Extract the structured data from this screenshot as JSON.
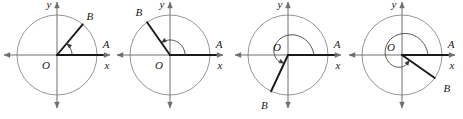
{
  "figure_set": {
    "description": "Four unit-circle diagrams showing angles in standard position with initial side OA on the positive x-axis and terminal side OB",
    "count": 4,
    "colors": {
      "axis": "#6e6e6e",
      "circle": "#8a8a8a",
      "ray": "#1a1a1a",
      "arc": "#3a3a3a",
      "label": "#1a1a1a",
      "background": "#ffffff"
    },
    "labels": {
      "origin": "O",
      "x_axis": "x",
      "y_axis": "y",
      "point_a": "A",
      "point_b": "B"
    }
  },
  "chart_data": {
    "type": "scatter",
    "title": "",
    "xlabel": "x",
    "ylabel": "y",
    "grid": false,
    "legend": null,
    "figures": [
      {
        "index": 1,
        "origin_label": "O",
        "origin_label_position": "below-left",
        "x_axis_label": "x",
        "y_axis_label": "y",
        "point_a_label": "A",
        "point_a_angle_deg": 0,
        "point_b_label": "B",
        "point_b_angle_deg": 50,
        "point_b_label_position": "upper-right-outside",
        "terminal_side_angle_deg": 50,
        "arc_start_deg": 0,
        "arc_end_deg": 50,
        "arc_turns": 0,
        "arc_direction": "counterclockwise",
        "quadrant": "I"
      },
      {
        "index": 2,
        "origin_label": "O",
        "origin_label_position": "below-left",
        "x_axis_label": "x",
        "y_axis_label": "y",
        "point_a_label": "A",
        "point_a_angle_deg": 0,
        "point_b_label": "B",
        "point_b_angle_deg": 125,
        "point_b_label_position": "upper-left-outside",
        "terminal_side_angle_deg": 125,
        "arc_start_deg": 0,
        "arc_end_deg": 125,
        "arc_turns": 0,
        "arc_direction": "counterclockwise",
        "quadrant": "II"
      },
      {
        "index": 3,
        "origin_label": "O",
        "origin_label_position": "above-left",
        "x_axis_label": "x",
        "y_axis_label": "y",
        "point_a_label": "A",
        "point_a_angle_deg": 0,
        "point_b_label": "B",
        "point_b_angle_deg": 245,
        "point_b_label_position": "lower-left-outside",
        "terminal_side_angle_deg": 245,
        "arc_start_deg": 0,
        "arc_end_deg": 245,
        "arc_turns": 0,
        "arc_direction": "counterclockwise",
        "quadrant": "III"
      },
      {
        "index": 4,
        "origin_label": "O",
        "origin_label_position": "above-left",
        "x_axis_label": "x",
        "y_axis_label": "y",
        "point_a_label": "A",
        "point_a_angle_deg": 0,
        "point_b_label": "B",
        "point_b_angle_deg": 325,
        "point_b_label_position": "lower-right-outside",
        "terminal_side_angle_deg": 325,
        "arc_start_deg": 0,
        "arc_end_deg": 325,
        "arc_turns": 0,
        "arc_direction": "counterclockwise",
        "quadrant": "IV"
      }
    ]
  }
}
